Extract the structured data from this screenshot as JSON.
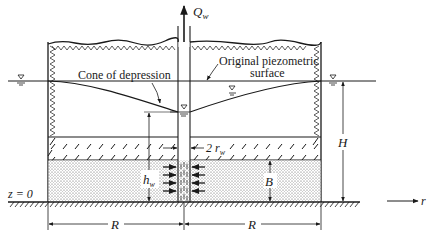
{
  "diagram": {
    "type": "confined-aquifer-well-drawdown",
    "labels": {
      "discharge": "Q",
      "discharge_sub": "w",
      "cone": "Cone of depression",
      "original_line1": "Original piezometric",
      "original_line2": "surface",
      "head": "H",
      "well_head": "h",
      "well_head_sub": "w",
      "well_diameter": "2 r",
      "well_diameter_sub": "w",
      "thickness": "B",
      "datum": "z = 0",
      "radius_left": "R",
      "radius_right": "R",
      "radial_axis": "r"
    },
    "colors": {
      "ink": "#1a1a1a",
      "aquifer_fill": "#d9d9d9",
      "background": "#ffffff"
    }
  }
}
